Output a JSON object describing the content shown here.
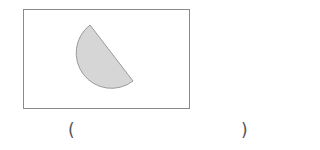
{
  "figure": {
    "shape": "semicircle inside rectangle",
    "rectangle": {
      "x": 23,
      "y": 9,
      "width": 166,
      "height": 99,
      "stroke": "#8a8a8a"
    },
    "semicircle": {
      "diameter_start": [
        90,
        25
      ],
      "diameter_end": [
        133,
        81
      ],
      "radius": 35,
      "fill": "#d6d6d6",
      "stroke": "#9a9a9a"
    }
  },
  "answer": {
    "open_paren": "(",
    "close_paren": ")",
    "value": ""
  }
}
